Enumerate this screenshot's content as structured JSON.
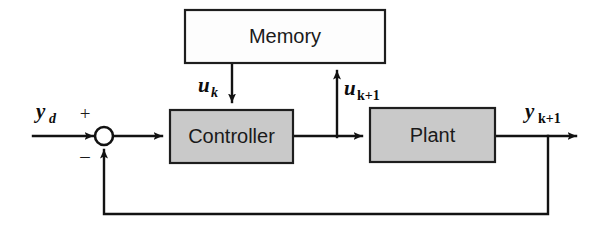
{
  "diagram": {
    "blocks": [
      {
        "id": "memory",
        "label": "Memory",
        "fill": "#fdfdfd",
        "stroke": "#1e1e1e"
      },
      {
        "id": "controller",
        "label": "Controller",
        "fill": "#c9c9c9",
        "stroke": "#1e1e1e"
      },
      {
        "id": "plant",
        "label": "Plant",
        "fill": "#c9c9c9",
        "stroke": "#1e1e1e"
      }
    ],
    "signals": {
      "reference": {
        "base": "y",
        "sub": "d",
        "full": "y_d"
      },
      "memory_in": {
        "base": "u",
        "sub": "k",
        "full": "u_k"
      },
      "memory_out": {
        "base": "u",
        "sub": "k+1",
        "full": "u_k+1"
      },
      "output": {
        "base": "y",
        "sub": "k+1",
        "full": "y_k+1"
      }
    },
    "summing_junction": {
      "name": "summing-junction",
      "plus_sign": "+",
      "minus_sign": "–"
    },
    "colors": {
      "line": "#121212",
      "block_gray": "#c9c9c9",
      "block_white": "#fdfdfd",
      "background": "#ffffff",
      "text": "#1a1a1a"
    }
  }
}
